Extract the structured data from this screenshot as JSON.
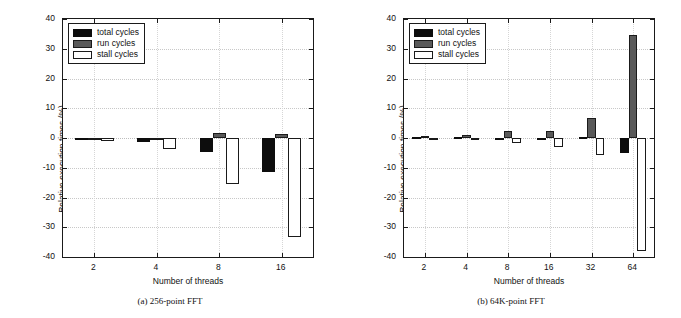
{
  "figure": {
    "background": "#ffffff",
    "colors": {
      "total": "#0d0d0d",
      "run": "#595959",
      "stall": "#ffffff",
      "axis": "#1a1a1a",
      "grid": "#c8c8c8"
    }
  },
  "panels": [
    {
      "id": "panel-a",
      "caption": "(a) 256-point FFT",
      "chart_data": {
        "type": "bar",
        "title": "",
        "subtitle": "",
        "xlabel": "Number of threads",
        "ylabel": "Relative execution times (%)",
        "categories": [
          "2",
          "4",
          "8",
          "16"
        ],
        "xtick_labels": [
          "2",
          "4",
          "8",
          "16"
        ],
        "ytick_labels": [
          "40",
          "30",
          "20",
          "10",
          "0",
          "-10",
          "-20",
          "-30",
          "-40"
        ],
        "ylim": [
          -40,
          40
        ],
        "yticks": [
          40,
          30,
          20,
          10,
          0,
          -10,
          -20,
          -30,
          -40
        ],
        "grid": true,
        "legend_position": "upper-left",
        "series": [
          {
            "name": "total cycles",
            "color": "#0d0d0d",
            "values": [
              -0.4,
              -1.5,
              -4.7,
              -11.3
            ]
          },
          {
            "name": "run cycles",
            "color": "#595959",
            "values": [
              -0.2,
              -0.3,
              1.6,
              1.5
            ]
          },
          {
            "name": "stall cycles",
            "color": "#ffffff",
            "values": [
              -1.0,
              -3.7,
              -15.4,
              -33.4
            ]
          }
        ]
      }
    },
    {
      "id": "panel-b",
      "caption": "(b) 64K-point FFT",
      "chart_data": {
        "type": "bar",
        "title": "",
        "subtitle": "",
        "xlabel": "Number of threads",
        "ylabel": "Relative execution times (%)",
        "categories": [
          "2",
          "4",
          "8",
          "16",
          "32",
          "64"
        ],
        "xtick_labels": [
          "2",
          "4",
          "8",
          "16",
          "32",
          "64"
        ],
        "ytick_labels": [
          "40",
          "30",
          "20",
          "10",
          "0",
          "-10",
          "-20",
          "-30",
          "-40"
        ],
        "ylim": [
          -40,
          40
        ],
        "yticks": [
          40,
          30,
          20,
          10,
          0,
          -10,
          -20,
          -30,
          -40
        ],
        "grid": true,
        "legend_position": "upper-left",
        "series": [
          {
            "name": "total cycles",
            "color": "#0d0d0d",
            "values": [
              0.2,
              0.5,
              0.1,
              -0.5,
              0.2,
              -5.1
            ]
          },
          {
            "name": "run cycles",
            "color": "#595959",
            "values": [
              0.6,
              1.1,
              2.4,
              2.2,
              6.7,
              34.5
            ]
          },
          {
            "name": "stall cycles",
            "color": "#ffffff",
            "values": [
              -0.4,
              0.1,
              -1.7,
              -2.9,
              -5.6,
              -38.0
            ]
          }
        ]
      }
    }
  ],
  "legend": {
    "items": [
      {
        "label": "total cycles",
        "key": "total"
      },
      {
        "label": "run cycles",
        "key": "run"
      },
      {
        "label": "stall cycles",
        "key": "stall"
      }
    ]
  }
}
